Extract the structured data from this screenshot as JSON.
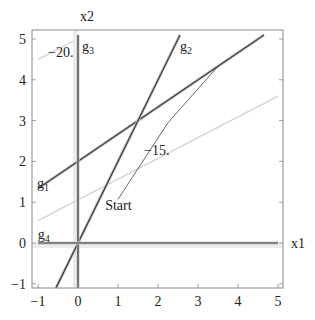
{
  "chart_data": {
    "type": "line",
    "title": "",
    "xlabel": "x1",
    "ylabel": "x2",
    "xlim": [
      -1,
      5
    ],
    "ylim": [
      -1.1,
      5.1
    ],
    "grid": false,
    "x_ticks": [
      -1,
      0,
      1,
      2,
      3,
      4,
      5
    ],
    "y_ticks": [
      -1,
      0,
      1,
      2,
      3,
      4,
      5
    ],
    "x_tick_labels": [
      "−1",
      "0",
      "1",
      "2",
      "3",
      "4",
      "5"
    ],
    "y_tick_labels": [
      "−1",
      "0",
      "1",
      "2",
      "3",
      "4",
      "5"
    ],
    "constraints": [
      {
        "name": "g1",
        "label_main": "g",
        "label_sub": "1",
        "equation": "x2 = 2 + (2/3) x1",
        "points": [
          [
            -1,
            1.333
          ],
          [
            4.65,
            5.1
          ]
        ],
        "label_pos": [
          -1.0,
          1.35
        ]
      },
      {
        "name": "g2",
        "label_main": "g",
        "label_sub": "2",
        "equation": "x2 = 2 x1",
        "points": [
          [
            -0.55,
            -1.1
          ],
          [
            2.55,
            5.1
          ]
        ],
        "label_pos": [
          2.5,
          4.95
        ]
      },
      {
        "name": "g3",
        "label_main": "g",
        "label_sub": "3",
        "equation": "x1 = 0",
        "points": [
          [
            0,
            -1.1
          ],
          [
            0,
            5.1
          ]
        ],
        "label_pos": [
          0.05,
          4.95
        ]
      },
      {
        "name": "g4",
        "label_main": "g",
        "label_sub": "4",
        "equation": "x2 = 0",
        "points": [
          [
            -1,
            0
          ],
          [
            5,
            0
          ]
        ],
        "label_pos": [
          -0.98,
          0.1
        ]
      }
    ],
    "contours": [
      {
        "label": "−20.",
        "value": -20,
        "points": [
          [
            -1,
            4.5
          ],
          [
            -0.1,
            4.95
          ]
        ],
        "label_pos": [
          -0.75,
          4.55
        ]
      },
      {
        "label": "−15.",
        "value": -15,
        "points": [
          [
            -1,
            0.55
          ],
          [
            5,
            3.6
          ]
        ],
        "label_pos": [
          1.65,
          2.15
        ]
      }
    ],
    "path": {
      "label": "Start",
      "points": [
        [
          1.0,
          1.07
        ],
        [
          2.25,
          2.95
        ],
        [
          3.5,
          4.33
        ]
      ],
      "label_pos": [
        0.68,
        0.82
      ]
    },
    "colors": {
      "constraint": "#3a3a3a",
      "constraint_halo": "#c8c8c8",
      "contour": "#d2d2d2",
      "path": "#555555",
      "frame": "#777777"
    }
  }
}
